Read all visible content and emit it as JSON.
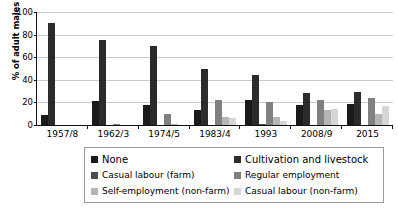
{
  "chart_data": {
    "type": "bar",
    "title": "",
    "xlabel": "",
    "ylabel": "% of adult males",
    "ylim": [
      0,
      100
    ],
    "yticks": [
      0,
      20,
      40,
      60,
      80,
      100
    ],
    "grid": true,
    "legend_position": "bottom",
    "categories": [
      "1957/8",
      "1962/3",
      "1974/5",
      "1983/4",
      "1993",
      "2008/9",
      "2015"
    ],
    "series": [
      {
        "name": "None",
        "color": "#1a1a1a",
        "values": [
          9,
          21.5,
          17.5,
          13.5,
          22,
          18,
          19
        ]
      },
      {
        "name": "Cultivation and livestock",
        "color": "#2b2b2b",
        "values": [
          90,
          75.5,
          69.5,
          50,
          44,
          28,
          29
        ]
      },
      {
        "name": "Casual labour (farm)",
        "color": "#4d4d4d",
        "values": [
          0,
          0,
          0,
          0,
          1,
          0,
          0
        ]
      },
      {
        "name": "Regular employment",
        "color": "#808080",
        "values": [
          0,
          1.2,
          10,
          22,
          20.5,
          22,
          24
        ]
      },
      {
        "name": "Self-employment (non-farm)",
        "color": "#b5b5b5",
        "values": [
          0,
          0,
          1.2,
          7.5,
          7,
          13,
          10
        ]
      },
      {
        "name": "Casual labour (non-farm)",
        "color": "#d6d6d6",
        "values": [
          0,
          0,
          0,
          6,
          3.5,
          14,
          17
        ]
      }
    ]
  },
  "legend": {
    "items": [
      {
        "label": "None",
        "color": "#1a1a1a"
      },
      {
        "label": "Cultivation and livestock",
        "color": "#2b2b2b"
      },
      {
        "label": "Casual labour (farm)",
        "color": "#4d4d4d"
      },
      {
        "label": "Regular employment",
        "color": "#808080"
      },
      {
        "label": "Self-employment (non-farm)",
        "color": "#b5b5b5"
      },
      {
        "label": "Casual labour (non-farm)",
        "color": "#d6d6d6"
      }
    ]
  },
  "axes": {
    "y_title": "% of adult males",
    "y_tick_labels": [
      "100",
      "80",
      "60",
      "40",
      "20",
      "0"
    ],
    "x_tick_labels": [
      "1957/8",
      "1962/3",
      "1974/5",
      "1983/4",
      "1993",
      "2008/9",
      "2015"
    ]
  }
}
